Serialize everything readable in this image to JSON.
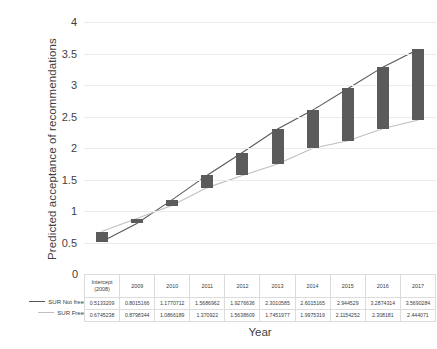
{
  "chart_data": {
    "type": "bar",
    "title": "",
    "xlabel": "Year",
    "ylabel": "Predicted acceptance of recommendations",
    "ylim": [
      0,
      4
    ],
    "yticks": [
      0,
      0.5,
      1,
      1.5,
      2,
      2.5,
      3,
      3.5,
      4
    ],
    "ytick_labels": [
      "0",
      "0.5",
      "1",
      "1.5",
      "2",
      "2.5",
      "3",
      "3.5",
      "4"
    ],
    "grid": true,
    "legend_position": "left-of-table",
    "categories": [
      "Intercept\n(2008)",
      "2009",
      "2010",
      "2011",
      "2012",
      "2013",
      "2014",
      "2015",
      "2016",
      "2017"
    ],
    "series": [
      {
        "name": "SUR Not free",
        "color": "#595959",
        "values": [
          0.5133209,
          0.8015166,
          1.1770712,
          1.5686962,
          1.9276636,
          2.3010585,
          2.6015165,
          2.944529,
          3.2874314,
          3.5690284
        ],
        "value_labels": [
          "0.5133209",
          "0.8015166",
          "1.1770712",
          "1.5686962",
          "1.9276636",
          "2.3010585",
          "2.6015165",
          "2.944529",
          "3.2874314",
          "3.5690284"
        ]
      },
      {
        "name": "SUR Free",
        "color": "#bfbfbf",
        "values": [
          0.6745238,
          0.8798344,
          1.0866189,
          1.370922,
          1.5638609,
          1.7451977,
          1.9975319,
          2.1154252,
          2.308181,
          2.444071
        ],
        "value_labels": [
          "0.6745238",
          "0.8798344",
          "1.0866189",
          "1.370922",
          "1.5638609",
          "1.7451977",
          "1.9975319",
          "2.1154252",
          "2.308181",
          "2.444071"
        ]
      }
    ],
    "bars": {
      "note": "vertical bars span between SUR Not free and SUR Free at each year",
      "color": "#5b5b5b"
    }
  },
  "table": {
    "header": [
      "Intercept",
      "(2008)",
      "2009",
      "2010",
      "2011",
      "2012",
      "2013",
      "2014",
      "2015",
      "2016",
      "2017"
    ],
    "header_cells": [
      {
        "line1": "Intercept",
        "line2": "(2008)"
      },
      {
        "line1": "2009",
        "line2": ""
      },
      {
        "line1": "2010",
        "line2": ""
      },
      {
        "line1": "2011",
        "line2": ""
      },
      {
        "line1": "2012",
        "line2": ""
      },
      {
        "line1": "2013",
        "line2": ""
      },
      {
        "line1": "2014",
        "line2": ""
      },
      {
        "line1": "2015",
        "line2": ""
      },
      {
        "line1": "2016",
        "line2": ""
      },
      {
        "line1": "2017",
        "line2": ""
      }
    ]
  },
  "legend": {
    "items": [
      {
        "label": "SUR Not free",
        "color": "#595959"
      },
      {
        "label": "SUR Free",
        "color": "#bfbfbf"
      }
    ]
  },
  "axes": {
    "y_title": "Predicted acceptance of recommendations",
    "x_title": "Year",
    "zero_label": "0"
  }
}
